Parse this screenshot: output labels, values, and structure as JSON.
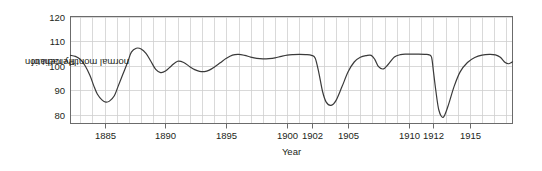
{
  "chart_data": {
    "type": "line",
    "title": "",
    "xlabel": "Year",
    "ylabel": "Percent of normal monthly radiation",
    "ylabel_line1": "Percent of",
    "ylabel_line2": "normal monthly radiation",
    "xlim": [
      1882.2,
      1918.5
    ],
    "ylim": [
      76.5,
      120
    ],
    "yticks": [
      80,
      90,
      100,
      110,
      120
    ],
    "xticks": [
      1885,
      1890,
      1895,
      1900,
      1902,
      1905,
      1910,
      1912,
      1915
    ],
    "xtick_labels": [
      "1885",
      "1890",
      "1895",
      "1900",
      "1902",
      "1905",
      "1910",
      "1912",
      "1915"
    ],
    "ytick_labels": [
      "80",
      "90",
      "100",
      "110",
      "120"
    ],
    "grid": true,
    "grid_x_step": 1,
    "grid_y_step": 10,
    "legend": "none",
    "line_color": "#3a3a3a",
    "grid_color": "#cfcfcf",
    "axis_color": "#6b6b6b",
    "text_color": "#231f20",
    "series": [
      {
        "name": "Percent of normal monthly radiation",
        "x": [
          1882.2,
          1882.6,
          1883.0,
          1883.4,
          1883.8,
          1884.1,
          1884.4,
          1884.8,
          1885.1,
          1885.4,
          1885.8,
          1886.1,
          1886.5,
          1886.9,
          1887.2,
          1887.6,
          1888.0,
          1888.4,
          1888.8,
          1889.2,
          1889.6,
          1890.0,
          1890.5,
          1891.0,
          1891.5,
          1892.0,
          1892.4,
          1892.8,
          1893.2,
          1893.6,
          1894.0,
          1894.5,
          1895.0,
          1895.5,
          1896.0,
          1896.5,
          1897.0,
          1897.5,
          1898.0,
          1898.5,
          1899.0,
          1899.5,
          1900.0,
          1900.5,
          1901.0,
          1901.5,
          1902.0,
          1902.3,
          1902.6,
          1902.9,
          1903.2,
          1903.6,
          1904.0,
          1904.5,
          1905.0,
          1905.5,
          1906.0,
          1906.5,
          1906.9,
          1907.2,
          1907.5,
          1907.9,
          1908.3,
          1908.8,
          1909.3,
          1909.8,
          1910.3,
          1910.8,
          1911.3,
          1911.6,
          1911.85,
          1912.0,
          1912.2,
          1912.45,
          1912.8,
          1913.2,
          1913.7,
          1914.2,
          1914.8,
          1915.4,
          1916.0,
          1916.6,
          1917.1,
          1917.5,
          1917.9,
          1918.2,
          1918.5
        ],
        "y": [
          104.2,
          103.8,
          102.6,
          100.0,
          96.0,
          92.0,
          88.5,
          86.0,
          85.2,
          85.6,
          87.8,
          91.5,
          96.5,
          101.5,
          105.5,
          107.1,
          106.8,
          105.0,
          101.8,
          98.5,
          97.2,
          97.8,
          100.0,
          101.8,
          101.3,
          99.6,
          98.4,
          97.7,
          97.6,
          98.2,
          99.4,
          101.2,
          103.0,
          104.3,
          104.6,
          104.2,
          103.5,
          103.0,
          102.8,
          102.9,
          103.2,
          103.8,
          104.3,
          104.5,
          104.6,
          104.5,
          104.2,
          103.0,
          97.0,
          89.5,
          85.2,
          83.9,
          85.8,
          91.5,
          97.5,
          101.5,
          103.4,
          104.1,
          104.2,
          102.5,
          99.6,
          98.7,
          100.6,
          103.5,
          104.5,
          104.7,
          104.7,
          104.7,
          104.6,
          104.5,
          103.5,
          98.0,
          90.0,
          82.0,
          79.0,
          83.5,
          91.5,
          97.5,
          101.3,
          103.3,
          104.3,
          104.6,
          104.4,
          103.4,
          101.3,
          100.8,
          101.6
        ]
      }
    ]
  }
}
